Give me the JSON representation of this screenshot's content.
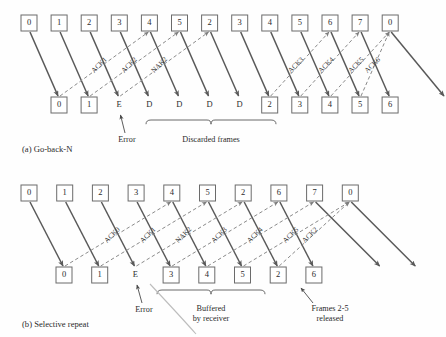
{
  "figure": {
    "title_a": "(a)  Go-back-N",
    "title_b": "(b)  Selective repeat"
  },
  "panel_a": {
    "sender_frames": [
      "0",
      "1",
      "2",
      "3",
      "4",
      "5",
      "2",
      "3",
      "4",
      "5",
      "6",
      "7",
      "0"
    ],
    "receiver_items": [
      {
        "label": "0",
        "boxed": true
      },
      {
        "label": "1",
        "boxed": true
      },
      {
        "label": "E",
        "boxed": false
      },
      {
        "label": "D",
        "boxed": false
      },
      {
        "label": "D",
        "boxed": false
      },
      {
        "label": "D",
        "boxed": false
      },
      {
        "label": "D",
        "boxed": false
      },
      {
        "label": "2",
        "boxed": true
      },
      {
        "label": "3",
        "boxed": true
      },
      {
        "label": "4",
        "boxed": true
      },
      {
        "label": "5",
        "boxed": true
      },
      {
        "label": "6",
        "boxed": true
      }
    ],
    "ack_labels": [
      "ACK1",
      "ACK2",
      "NAK2",
      "ACK3",
      "ACK4",
      "ACK5",
      "ACK6"
    ],
    "annotations": {
      "error": "Error",
      "discarded": "Discarded frames"
    }
  },
  "panel_b": {
    "sender_frames": [
      "0",
      "1",
      "2",
      "3",
      "4",
      "5",
      "2",
      "6",
      "7",
      "0"
    ],
    "receiver_items": [
      {
        "label": "0",
        "boxed": true
      },
      {
        "label": "1",
        "boxed": true
      },
      {
        "label": "E",
        "boxed": false
      },
      {
        "label": "3",
        "boxed": true
      },
      {
        "label": "4",
        "boxed": true
      },
      {
        "label": "5",
        "boxed": true
      },
      {
        "label": "2",
        "boxed": true
      },
      {
        "label": "6",
        "boxed": true
      }
    ],
    "ack_labels": [
      "ACK0",
      "ACK1",
      "NAK2",
      "ACK3",
      "ACK4",
      "ACK5",
      "ACK2"
    ],
    "annotations": {
      "error": "Error",
      "buffered_line1": "Buffered",
      "buffered_line2": "by receiver",
      "released_line1": "Frames 2-5",
      "released_line2": "released"
    }
  },
  "colors": {
    "box_stroke": "#6b6b6b",
    "solid_arrow": "#595959",
    "dashed_arrow": "#8a8a8a",
    "text": "#2b2b2b",
    "background": "#fefefe"
  }
}
